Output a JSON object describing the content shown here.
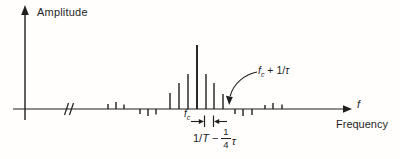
{
  "labels": {
    "y_axis": "Amplitude",
    "x_axis_symbol": "f",
    "x_axis_name": "Frequency",
    "carrier": {
      "base": "f",
      "sub": "c"
    },
    "first_null": {
      "base": "f",
      "sub": "c",
      "rest": " + 1/",
      "tau": "τ"
    },
    "line_spacing": {
      "pre": "1/",
      "T": "T",
      "op": "−",
      "num": "1",
      "den": "4",
      "tau": "τ"
    }
  },
  "colors": {
    "ink": "#1f1f1f",
    "bg": "#fffefd"
  },
  "chart_data": {
    "type": "stem",
    "x_axis": {
      "symbol": "f",
      "label": "Frequency",
      "numeric_ticks": false,
      "break_near_origin": true
    },
    "y_axis": {
      "label": "Amplitude",
      "numeric_ticks": false
    },
    "annotations": [
      {
        "text": "f_c + 1/τ",
        "points_to": "first spectral null right of the main lobe (curved arrow to axis)"
      },
      {
        "text": "1/T − ¼τ",
        "marks": "spacing between the two spectral lines immediately right of f_c (inward-pointing arrows)"
      },
      {
        "text": "f_c",
        "marks": "tallest central spectral line"
      }
    ],
    "layout": {
      "axis_y_px": 109,
      "origin_x_px": 25,
      "fc_x_px": 197,
      "line_spacing_px": 8.7,
      "first_null_x_px": 230
    },
    "stems": [
      {
        "x_px": 108,
        "amp_px": 5
      },
      {
        "x_px": 116,
        "amp_px": 7
      },
      {
        "x_px": 124,
        "amp_px": 4.5
      },
      {
        "x_px": 140,
        "amp_px": -5
      },
      {
        "x_px": 148,
        "amp_px": -7
      },
      {
        "x_px": 156,
        "amp_px": -5.5
      },
      {
        "x_px": 170,
        "amp_px": 16
      },
      {
        "x_px": 179,
        "amp_px": 26
      },
      {
        "x_px": 188,
        "amp_px": 35
      },
      {
        "x_px": 197,
        "amp_px": 64
      },
      {
        "x_px": 206,
        "amp_px": 35
      },
      {
        "x_px": 214,
        "amp_px": 26
      },
      {
        "x_px": 223,
        "amp_px": 15
      },
      {
        "x_px": 235,
        "amp_px": -5
      },
      {
        "x_px": 243,
        "amp_px": -7
      },
      {
        "x_px": 252,
        "amp_px": -6
      },
      {
        "x_px": 265,
        "amp_px": 4
      },
      {
        "x_px": 273,
        "amp_px": 6
      },
      {
        "x_px": 282,
        "amp_px": 4.5
      }
    ]
  }
}
